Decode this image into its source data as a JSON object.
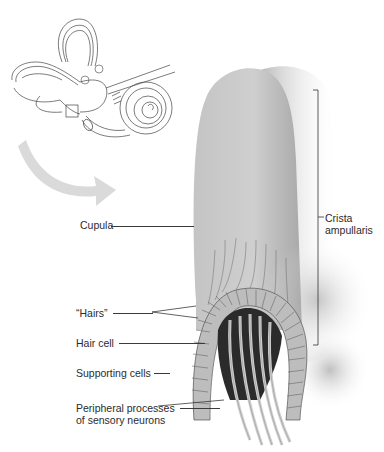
{
  "figure": {
    "inset": {
      "subject": "inner-ear-labyrinth",
      "markers": [
        {
          "label": "A",
          "x": 99,
          "y": 71
        },
        {
          "label": "A",
          "x": 85,
          "y": 81
        },
        {
          "label": "A",
          "x": 71,
          "y": 111
        }
      ]
    },
    "main_subject": "crista-ampullaris-cross-section",
    "labels": {
      "cupula": "Cupula",
      "crista_line1": "Crista",
      "crista_line2": "ampullaris",
      "hairs": "“Hairs”",
      "hair_cell": "Hair cell",
      "supporting_cells": "Supporting cells",
      "peripheral_line1": "Peripheral processes",
      "peripheral_line2": "of sensory neurons"
    },
    "colors": {
      "cupula": "#c9c9c9",
      "cupula_shade": "#9a9a9a",
      "arrow": "#d9d9d9",
      "line": "#333333",
      "cells": "#b8b8b8",
      "dark_core": "#2a2a2a"
    }
  }
}
